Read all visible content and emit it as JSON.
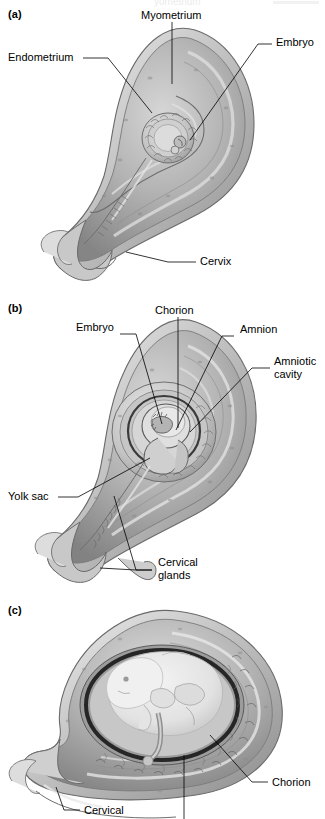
{
  "figure": {
    "background": "#ffffff",
    "ink": "#000000",
    "tone_dark": "#6f6f6f",
    "tone_mid": "#9a9a9a",
    "tone_light": "#c9c9c9",
    "tone_pale": "#e2e2e2",
    "cavity_dark": "#2a2a2a",
    "fetus": "#ebebeb"
  },
  "panels": [
    {
      "id": "a",
      "label": "(a)",
      "caption_labels": [
        {
          "name": "myometrium",
          "text": "Myometrium"
        },
        {
          "name": "embryo",
          "text": "Embryo"
        },
        {
          "name": "endometrium",
          "text": "Endometrium"
        },
        {
          "name": "cervix",
          "text": "Cervix"
        }
      ]
    },
    {
      "id": "b",
      "label": "(b)",
      "caption_labels": [
        {
          "name": "chorion",
          "text": "Chorion"
        },
        {
          "name": "embryo",
          "text": "Embryo"
        },
        {
          "name": "amnion",
          "text": "Amnion"
        },
        {
          "name": "amniotic-cavity",
          "text": "Amniotic\ncavity"
        },
        {
          "name": "yolk-sac",
          "text": "Yolk sac"
        },
        {
          "name": "cervical-glands",
          "text": "Cervical\nglands"
        }
      ]
    },
    {
      "id": "c",
      "label": "(c)",
      "caption_labels": [
        {
          "name": "chorion",
          "text": "Chorion"
        },
        {
          "name": "cervical",
          "text": "Cervical"
        }
      ]
    }
  ],
  "labels": {
    "a_myometrium": "Myometrium",
    "a_embryo": "Embryo",
    "a_endometrium": "Endometrium",
    "a_cervix": "Cervix",
    "b_chorion": "Chorion",
    "b_embryo": "Embryo",
    "b_amnion": "Amnion",
    "b_amniotic_cavity": "Amniotic\ncavity",
    "b_yolk_sac": "Yolk sac",
    "b_cervical_glands": "Cervical\nglands",
    "c_chorion": "Chorion",
    "c_cervical": "Cervical",
    "panel_a": "(a)",
    "panel_b": "(b)",
    "panel_c": "(c)"
  },
  "bleed": {
    "top_text": "yometrium"
  }
}
